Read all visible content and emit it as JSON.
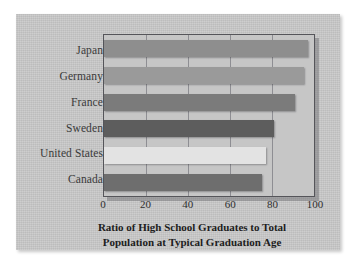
{
  "chart_data": {
    "type": "bar",
    "orientation": "horizontal",
    "title": "",
    "categories": [
      "Japan",
      "Germany",
      "France",
      "Sweden",
      "United States",
      "Canada"
    ],
    "values": [
      97,
      95,
      91,
      81,
      77,
      75
    ],
    "bar_colors": [
      "#8e8e8e",
      "#9a9a9a",
      "#7b7b7b",
      "#5d5d5d",
      "#e3e3e3",
      "#6e6e6e"
    ],
    "xlabel": "Ratio of High School Graduates to Total Population at Typical Graduation Age",
    "ylabel": "",
    "xlim": [
      0,
      100
    ],
    "xticks": [
      0,
      20,
      40,
      60,
      80,
      100
    ],
    "xtick_labels": [
      "0",
      "20",
      "40",
      "60",
      "80",
      "100"
    ],
    "grid": true,
    "gridlines_at": [
      20,
      40,
      60,
      80
    ],
    "legend": false,
    "legend_position": "none"
  },
  "caption": {
    "line1": "Ratio of High School Graduates to Total",
    "line2": "Population at Typical Graduation Age"
  },
  "style": {
    "panel_background": "#c9c9c9",
    "plot_background": "#c6c6c6",
    "frame_color": "#55555a",
    "gridline_color": "#8e8e93",
    "text_color": "#2e2e2e",
    "page_background": "#ffffff"
  }
}
